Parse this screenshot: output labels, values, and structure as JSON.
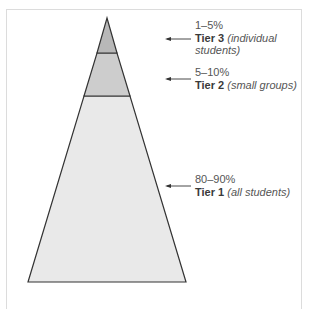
{
  "diagram": {
    "type": "pyramid",
    "colors": {
      "tier3_fill": "#b8b8b8",
      "tier2_fill": "#cdcdcd",
      "tier1_fill": "#e9e9e9",
      "outline": "#333333"
    },
    "tiers": [
      {
        "percent": "1–5%",
        "name": "Tier 3",
        "desc": "(individual students)",
        "desc_line1": "(individual",
        "desc_line2": "students)"
      },
      {
        "percent": "5–10%",
        "name": "Tier 2",
        "desc": "(small groups)"
      },
      {
        "percent": "80–90%",
        "name": "Tier 1",
        "desc": "(all students)"
      }
    ]
  }
}
